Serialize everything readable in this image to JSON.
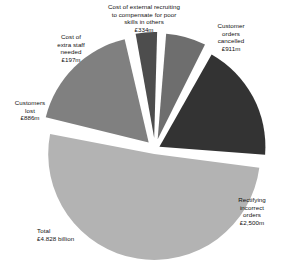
{
  "chart_data": {
    "type": "pie",
    "title": "",
    "subtitle": "",
    "xlabel": "",
    "ylabel": "",
    "legend_position": "none",
    "grid": false,
    "units": "£ million",
    "total_label": "Total",
    "total_value_text": "£4.828 billion",
    "total_value": 4828,
    "categories": [
      "Customer orders cancelled",
      "Rectifying incorrect orders",
      "Customers lost",
      "Cost of extra staff needed",
      "Cost of external recruiting to compensate for poor skills in others"
    ],
    "values": [
      911,
      2500,
      886,
      197,
      334
    ],
    "value_texts": [
      "£911m",
      "£2,500m",
      "£886m",
      "£197m",
      "£334m"
    ],
    "slices": [
      {
        "key": "cancelled",
        "name": "Customer orders cancelled",
        "label_text": "Customer\norders\ncancelled\n£911m",
        "value": 911,
        "value_text": "£911m",
        "percent": 18.9,
        "color": "#333333"
      },
      {
        "key": "rectifying",
        "name": "Rectifying incorrect orders",
        "label_text": "Rectifying\nincorrect\norders\n£2,500m",
        "value": 2500,
        "value_text": "£2,500m",
        "percent": 51.8,
        "color": "#b3b3b3"
      },
      {
        "key": "customers-lost",
        "name": "Customers lost",
        "label_text": "Customers\nlost\n£886m",
        "value": 886,
        "value_text": "£886m",
        "percent": 18.3,
        "color": "#808080"
      },
      {
        "key": "extra-staff",
        "name": "Cost of extra staff needed",
        "label_text": "Cost of\nextra staff\nneeded\n£197m",
        "value": 197,
        "value_text": "£197m",
        "percent": 4.1,
        "color": "#4d4d4d"
      },
      {
        "key": "external-recruiting",
        "name": "Cost of external recruiting to compensate for poor skills in others",
        "label_text": "Cost of external recruiting\nto compensate for poor\nskills in others\n£334m",
        "value": 334,
        "value_text": "£334m",
        "percent": 6.9,
        "color": "#6e6e6e"
      }
    ],
    "total_text": "Total\n£4.828 billion"
  },
  "colors": {
    "background": "#ffffff",
    "text": "#111111",
    "slice_gap": "#ffffff",
    "dark": "#333333",
    "mid_dark": "#4d4d4d",
    "mid": "#6e6e6e",
    "mid_light": "#808080",
    "light": "#b3b3b3"
  }
}
